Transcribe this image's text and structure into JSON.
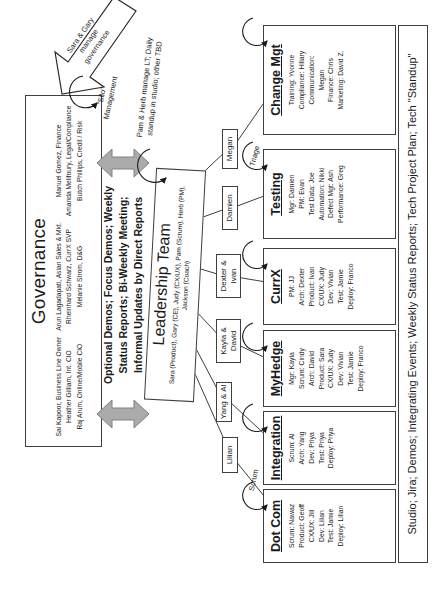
{
  "governance": {
    "title": "Governance",
    "columns": [
      {
        "lines": [
          "Sai Kapoor, Business Line Owner",
          "Heather Gilliam, Int. CIO",
          "Raj Arum, Online/Mobile CIO"
        ]
      },
      {
        "lines": [
          "Arun Lagadapati, Asian Sales & Mkt.",
          "Rheinhard Schwarz, CurrX SVP",
          "Melanie Strom, D&G"
        ]
      },
      {
        "lines": [
          "Manuel Gomez, Finance",
          "Amanda Melifoury, Legal/Compliance",
          "Butch Phillips, Credit / Risk"
        ]
      }
    ]
  },
  "manage_arrow": {
    "lines": [
      "Sara & Gary",
      "manage",
      "governance"
    ]
  },
  "silo_label": {
    "lines": [
      "\"Silo\"",
      "Management"
    ]
  },
  "exchange_text": {
    "lines": [
      "Optional Demos; Focus Demos; Weekly",
      "Status Reports; Bi-Weekly Meeting;",
      "Informal Updates by Direct Reports"
    ]
  },
  "pam_herb": {
    "lines": [
      "Pam & Herb manage LT; Daily",
      "standup in studio; other TBD"
    ]
  },
  "leadership": {
    "title": "Leadership Team",
    "lines": [
      "Sara (Product), Gary (CE), Judy (CX/UX), Pam (Scrum), Herb (PM),",
      "Jackson (Coach)"
    ]
  },
  "labels": {
    "scrum": "Scrum",
    "triage": "Triage"
  },
  "leads": [
    {
      "name": "Lilian"
    },
    {
      "name": "Yang & Al"
    },
    {
      "name": "Kayla & David"
    },
    {
      "name": "Dexter & Ivan"
    },
    {
      "name": "Damien"
    },
    {
      "name": "Megan"
    }
  ],
  "teams": [
    {
      "title": "Dot Com",
      "roster": [
        "Scrum: Nawaz",
        "Product: Geoff",
        "CX/UX: Jill",
        "Dev: Lilian",
        "Test: Jamie",
        "Deploy: Lilian"
      ]
    },
    {
      "title": "Integration",
      "roster": [
        "Scrum: Al",
        "Arch: Yang",
        "Dev: Priya",
        "Test: Priya",
        "Deploy: Priya"
      ]
    },
    {
      "title": "MyHedge",
      "roster": [
        "Mgr: Kayla",
        "Scrum: Cindy",
        "Arch: David",
        "Product: Sara",
        "CX/UX: Judy",
        "Dev: Vivian",
        "Test: Jamie",
        "Deploy: Franco"
      ]
    },
    {
      "title": "CurrX",
      "roster": [
        "PM: JJ",
        "Arch: Dexter",
        "Product: Ivan",
        "CX/UX: Judy",
        "Dev: Vivian",
        "Test: Jamie",
        "Deploy: Franco"
      ]
    },
    {
      "title": "Testing",
      "roster": [
        "Mgr: Damien",
        "PM: Evan",
        "Test Data: Joe",
        "Automation: Nikki",
        "Defect Mgt: Ash",
        "Performance: Greg"
      ]
    },
    {
      "title": "Change Mgt",
      "roster": [
        "Training: Yvonne",
        "Compliance: Hillary",
        "Communication:",
        "Megan",
        "Finance: Chris",
        "Marketing: David Z."
      ]
    }
  ],
  "footer": {
    "text": "Studio; Jira; Demos; Integrating Events; Weekly Status Reports; Tech Project Plan; Tech \"Standup\""
  },
  "colors": {
    "double_arrow_fill": "#ababab",
    "double_arrow_stroke": "#808080",
    "line": "#3f3f3f"
  }
}
